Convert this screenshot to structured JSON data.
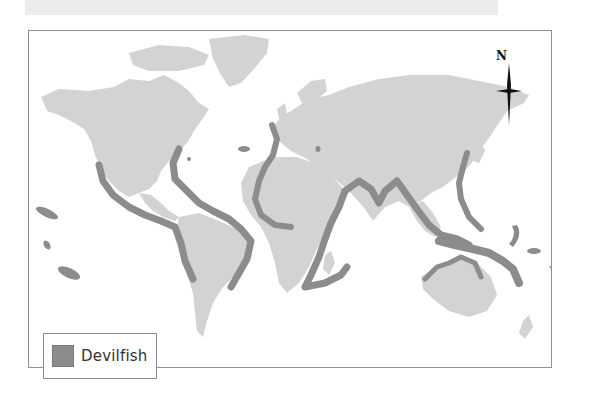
{
  "map": {
    "title": "",
    "compass": {
      "label": "N"
    },
    "legend": {
      "items": [
        {
          "label": "Devilfish",
          "color": "#8c8c8c"
        }
      ]
    },
    "colors": {
      "land": "#d3d3d3",
      "range": "#8c8c8c",
      "water": "#ffffff",
      "frame": "#8f8f8f"
    }
  }
}
